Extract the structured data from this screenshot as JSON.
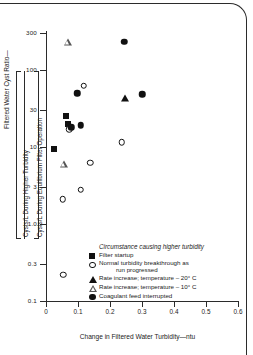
{
  "chart_data": {
    "type": "scatter",
    "title": "",
    "xlabel": "Change in Filtered Water Turbidity—ntu",
    "ylabel_outer": "Filtered Water Cyst Ratio—",
    "ylabel_numerator": "Cysts/L During Higher Turbidity",
    "ylabel_denominator": "Cysts/L During Equilibrium Filter Operation",
    "xlim": [
      0,
      0.6
    ],
    "ylim": [
      0.1,
      300
    ],
    "yscale": "log",
    "grid": false,
    "xticks": [
      "0",
      "0.1",
      "0.2",
      "0.3",
      "0.4",
      "0.5",
      "0.6"
    ],
    "xtick_values": [
      0,
      0.1,
      0.2,
      0.3,
      0.4,
      0.5,
      0.6
    ],
    "yticks": [
      "300",
      "100",
      "30",
      "10",
      "3",
      "1.0",
      "0.3",
      "0.1"
    ],
    "ytick_values": [
      300,
      100,
      30,
      10,
      3,
      1.0,
      0.3,
      0.1
    ],
    "legend_title": "Circumstance causing higher turbidity",
    "legend_position": "inside-lower-right",
    "series": [
      {
        "name": "Filter startup",
        "marker": "filled-square",
        "points": [
          {
            "x": 0.025,
            "y": 9.5
          },
          {
            "x": 0.062,
            "y": 25.0
          },
          {
            "x": 0.068,
            "y": 20.0
          }
        ]
      },
      {
        "name": "Normal turbidity breakthrough as run progressed",
        "marker": "open-circle",
        "points": [
          {
            "x": 0.072,
            "y": 17.0
          },
          {
            "x": 0.118,
            "y": 62.0
          },
          {
            "x": 0.138,
            "y": 6.2
          },
          {
            "x": 0.108,
            "y": 2.8
          },
          {
            "x": 0.052,
            "y": 2.1
          },
          {
            "x": 0.054,
            "y": 0.22
          },
          {
            "x": 0.236,
            "y": 11.5
          }
        ]
      },
      {
        "name": "Rate increase; temperature – 20° C",
        "marker": "filled-triangle",
        "points": [
          {
            "x": 0.247,
            "y": 43.0
          }
        ]
      },
      {
        "name": "Rate increase; temperature – 10° C",
        "marker": "open-triangle",
        "points": [
          {
            "x": 0.068,
            "y": 230.0
          },
          {
            "x": 0.055,
            "y": 6.0
          }
        ]
      },
      {
        "name": "Coagulant feed interrupted",
        "marker": "filled-circle",
        "points": [
          {
            "x": 0.098,
            "y": 50.0
          },
          {
            "x": 0.108,
            "y": 19.0
          },
          {
            "x": 0.078,
            "y": 18.0
          },
          {
            "x": 0.3,
            "y": 48.0
          },
          {
            "x": 0.245,
            "y": 230.0
          }
        ]
      }
    ]
  },
  "legend": {
    "title": "Circumstance causing higher turbidity",
    "entries": [
      {
        "marker": "filled-square",
        "label": "Filter startup",
        "label2": ""
      },
      {
        "marker": "open-circle",
        "label": "Normal turbidity breakthrough as",
        "label2": "run progressed"
      },
      {
        "marker": "filled-triangle",
        "label": "Rate increase; temperature – 20° C",
        "label2": ""
      },
      {
        "marker": "open-triangle",
        "label": "Rate increase; temperature – 10° C",
        "label2": ""
      },
      {
        "marker": "filled-circle",
        "label": "Coagulant feed interrupted",
        "label2": ""
      }
    ]
  },
  "colors": {
    "axis": "#2b2b2b",
    "marker": "#111111",
    "background": "#ffffff"
  }
}
